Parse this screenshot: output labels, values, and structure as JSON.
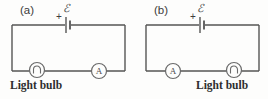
{
  "figure": {
    "background_color": "#fdfdfc",
    "line_color": "#555555",
    "width": 268,
    "height": 99,
    "type": "physics-circuit-diagram-pair"
  },
  "panels": [
    {
      "id": "a",
      "label": "(a)",
      "emf_symbol": "ℰ",
      "polarity_marker": "+",
      "battery_name": "battery-emf-source",
      "bottom_left_component": {
        "kind": "light-bulb",
        "symbol_letter": "",
        "name": "light-bulb-symbol"
      },
      "bottom_right_component": {
        "kind": "ammeter",
        "symbol_letter": "A",
        "name": "ammeter-symbol"
      },
      "caption": "Light bulb",
      "caption_side": "left"
    },
    {
      "id": "b",
      "label": "(b)",
      "emf_symbol": "ℰ",
      "polarity_marker": "+",
      "battery_name": "battery-emf-source",
      "bottom_left_component": {
        "kind": "ammeter",
        "symbol_letter": "A",
        "name": "ammeter-symbol"
      },
      "bottom_right_component": {
        "kind": "light-bulb",
        "symbol_letter": "",
        "name": "light-bulb-symbol"
      },
      "caption": "Light bulb",
      "caption_side": "right"
    }
  ],
  "colors": {
    "wire": "#555555",
    "text": "#2e2e2e",
    "label": "#3a3a3a",
    "component_stroke": "#6a6a6a"
  }
}
